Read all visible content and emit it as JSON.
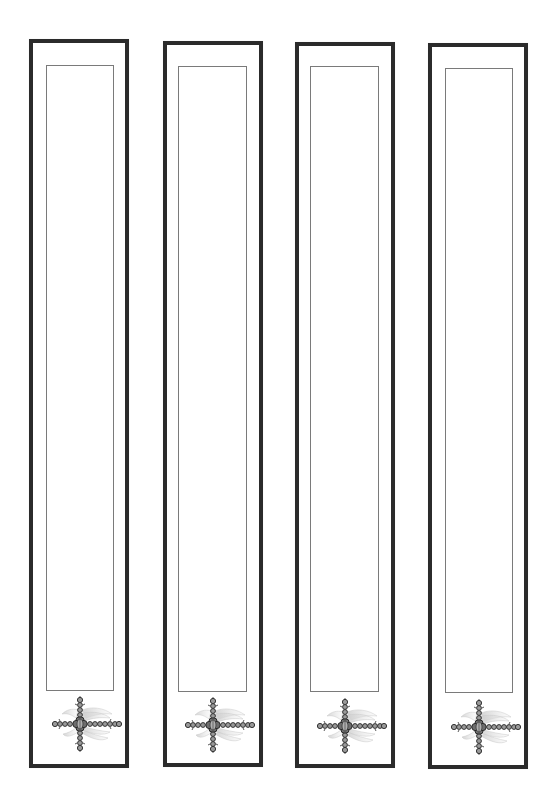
{
  "page": {
    "width": 557,
    "height": 803,
    "background": "#ffffff"
  },
  "style": {
    "outer_border_color": "#2b2b2b",
    "outer_border_width": 4,
    "inner_border_color": "#7a7a7a",
    "inner_border_width": 1,
    "ornament_dark": "#3a3a3a",
    "ornament_mid": "#8a8a8a",
    "ornament_light": "#d6d6d6"
  },
  "bookmarks": [
    {
      "id": "bookmark-1",
      "outer": {
        "x": 29,
        "y": 39,
        "w": 100,
        "h": 729
      },
      "inner": {
        "x": 46,
        "y": 65,
        "w": 68,
        "h": 626
      },
      "ornament": {
        "icon": "ornate-cross-icon",
        "cx": 80,
        "cy": 724
      },
      "text": ""
    },
    {
      "id": "bookmark-2",
      "outer": {
        "x": 163,
        "y": 41,
        "w": 100,
        "h": 726
      },
      "inner": {
        "x": 178,
        "y": 66,
        "w": 69,
        "h": 626
      },
      "ornament": {
        "icon": "ornate-cross-icon",
        "cx": 213,
        "cy": 725
      },
      "text": ""
    },
    {
      "id": "bookmark-3",
      "outer": {
        "x": 295,
        "y": 42,
        "w": 100,
        "h": 726
      },
      "inner": {
        "x": 310,
        "y": 66,
        "w": 69,
        "h": 626
      },
      "ornament": {
        "icon": "ornate-cross-icon",
        "cx": 345,
        "cy": 726
      },
      "text": ""
    },
    {
      "id": "bookmark-4",
      "outer": {
        "x": 428,
        "y": 43,
        "w": 100,
        "h": 726
      },
      "inner": {
        "x": 445,
        "y": 68,
        "w": 68,
        "h": 625
      },
      "ornament": {
        "icon": "ornate-cross-icon",
        "cx": 479,
        "cy": 727
      },
      "text": ""
    }
  ]
}
